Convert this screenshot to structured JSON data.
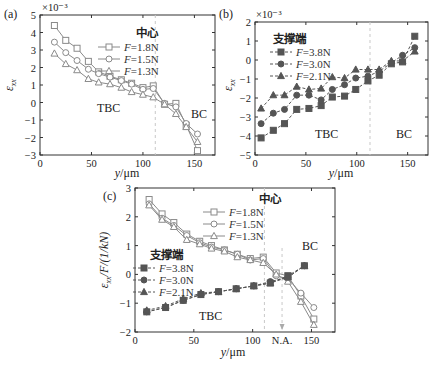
{
  "chart_data": [
    {
      "id": "a",
      "type": "line",
      "panel_label": "(a)",
      "title": "",
      "xlabel": "y/μm",
      "ylabel": "ε_xx",
      "y_multiplier": "×10⁻³",
      "xlim": [
        0,
        170
      ],
      "ylim": [
        -3,
        5
      ],
      "xticks": [
        0,
        50,
        100,
        150
      ],
      "yticks": [
        -3,
        -2,
        -1,
        0,
        1,
        2,
        3,
        4,
        5
      ],
      "grid": false,
      "legend_title": "中心",
      "legend_position": "upper right",
      "regions": [
        "TBC",
        "BC"
      ],
      "interface_x": 112,
      "series": [
        {
          "name": "F=1.8N",
          "marker": "square",
          "x": [
            14,
            25,
            36,
            47,
            57,
            68,
            79,
            89,
            100,
            110,
            121,
            132,
            142,
            153
          ],
          "y": [
            4.4,
            3.55,
            3.1,
            2.35,
            1.75,
            1.5,
            1.3,
            1.1,
            0.85,
            0.95,
            -0.1,
            -0.05,
            -1.3,
            -2.75
          ]
        },
        {
          "name": "F=1.5N",
          "marker": "circle",
          "x": [
            14,
            25,
            36,
            47,
            57,
            68,
            79,
            89,
            100,
            110,
            121,
            132,
            142,
            153
          ],
          "y": [
            3.45,
            2.85,
            2.4,
            1.9,
            1.65,
            1.45,
            1.25,
            1.05,
            0.75,
            0.8,
            -0.05,
            -0.25,
            -1.2,
            -1.8
          ]
        },
        {
          "name": "F=1.3N",
          "marker": "triangle",
          "x": [
            14,
            25,
            36,
            47,
            57,
            68,
            79,
            89,
            100,
            110,
            121,
            132,
            142,
            153
          ],
          "y": [
            2.8,
            2.2,
            1.85,
            1.35,
            1.15,
            1.05,
            0.85,
            0.6,
            0.45,
            0.3,
            -0.1,
            -0.65,
            -1.4,
            -2.25
          ]
        }
      ]
    },
    {
      "id": "b",
      "type": "line",
      "panel_label": "(b)",
      "title": "",
      "xlabel": "y/μm",
      "ylabel": "ε_xx",
      "y_multiplier": "×10⁻³",
      "xlim": [
        0,
        170
      ],
      "ylim": [
        -5,
        2
      ],
      "xticks": [
        0,
        50,
        100,
        150
      ],
      "yticks": [
        -5,
        -4,
        -3,
        -2,
        -1,
        0,
        1,
        2
      ],
      "grid": false,
      "legend_title": "支撑端",
      "legend_position": "upper left",
      "regions": [
        "TBC",
        "BC"
      ],
      "interface_x": 113,
      "series": [
        {
          "name": "F=3.8N",
          "marker": "square-filled",
          "x": [
            6,
            18,
            29,
            41,
            53,
            65,
            76,
            88,
            99,
            111,
            122,
            134,
            145,
            157
          ],
          "y": [
            -4.1,
            -3.7,
            -3.35,
            -2.6,
            -2.55,
            -2.4,
            -1.95,
            -1.9,
            -1.55,
            -1.1,
            -0.8,
            -0.2,
            -0.1,
            1.25
          ]
        },
        {
          "name": "F=3.0N",
          "marker": "circle-filled",
          "x": [
            6,
            18,
            29,
            41,
            53,
            65,
            76,
            88,
            99,
            111,
            122,
            134,
            145,
            157
          ],
          "y": [
            -3.35,
            -2.8,
            -2.6,
            -1.85,
            -1.85,
            -2.1,
            -1.55,
            -1.3,
            -0.95,
            -0.85,
            -0.6,
            -0.15,
            0.25,
            0.65
          ]
        },
        {
          "name": "F=2.1N",
          "marker": "triangle-filled",
          "x": [
            6,
            18,
            29,
            41,
            53,
            65,
            76,
            88,
            99,
            111,
            122,
            134,
            145,
            157
          ],
          "y": [
            -2.55,
            -1.85,
            -1.85,
            -1.4,
            -1.55,
            -1.5,
            -0.9,
            -0.95,
            -0.5,
            -0.5,
            -0.5,
            -0.05,
            -0.05,
            0.45
          ]
        }
      ]
    },
    {
      "id": "c",
      "type": "line",
      "panel_label": "(c)",
      "title": "",
      "xlabel": "y/μm",
      "ylabel": "ε_xx/F/(1/kN)",
      "xlim": [
        0,
        170
      ],
      "ylim": [
        -2,
        3
      ],
      "xticks": [
        0,
        50,
        100,
        150
      ],
      "xtick_extra": "N.A.",
      "yticks": [
        -2,
        -1,
        0,
        1,
        2,
        3
      ],
      "grid": false,
      "legend_groups": [
        {
          "title": "中心",
          "entries": [
            "F=1.8N",
            "F=1.5N",
            "F=1.3N"
          ],
          "position": "upper right"
        },
        {
          "title": "支撑端",
          "entries": [
            "F=3.8N",
            "F=3.0N",
            "F=2.1N"
          ],
          "position": "middle left"
        }
      ],
      "regions": [
        "TBC",
        "BC"
      ],
      "interface_x": 110,
      "neutral_axis_x": 125,
      "series": [
        {
          "name": "F=1.8N (中心)",
          "marker": "square",
          "x": [
            12,
            23,
            33,
            44,
            55,
            65,
            76,
            87,
            98,
            109,
            120,
            130,
            141,
            152
          ],
          "y": [
            2.6,
            2.1,
            1.8,
            1.4,
            1.15,
            1.0,
            0.85,
            0.7,
            0.55,
            0.6,
            0.05,
            -0.05,
            -0.75,
            -1.55
          ]
        },
        {
          "name": "F=1.5N (中心)",
          "marker": "circle",
          "x": [
            12,
            23,
            33,
            44,
            55,
            65,
            76,
            87,
            98,
            109,
            120,
            130,
            141,
            152
          ],
          "y": [
            2.45,
            1.95,
            1.7,
            1.35,
            1.1,
            0.95,
            0.85,
            0.7,
            0.5,
            0.55,
            -0.05,
            -0.15,
            -0.65,
            -1.15
          ]
        },
        {
          "name": "F=1.3N (中心)",
          "marker": "triangle",
          "x": [
            12,
            23,
            33,
            44,
            55,
            65,
            76,
            87,
            98,
            109,
            120,
            130,
            141,
            152
          ],
          "y": [
            2.4,
            1.9,
            1.65,
            1.2,
            1.05,
            0.9,
            0.8,
            0.6,
            0.5,
            0.4,
            0.0,
            -0.25,
            -0.95,
            -1.75
          ]
        },
        {
          "name": "F=3.8N (支撑端)",
          "marker": "square-filled",
          "x": [
            10,
            26,
            41,
            56,
            71,
            86,
            101,
            115,
            130,
            144
          ],
          "y": [
            -1.3,
            -1.15,
            -0.9,
            -0.7,
            -0.6,
            -0.5,
            -0.4,
            -0.3,
            -0.05,
            0.3
          ]
        },
        {
          "name": "F=3.0N (支撑端)",
          "marker": "circle-filled",
          "x": [
            10,
            26,
            41,
            56,
            71,
            86,
            101,
            115,
            130,
            144
          ],
          "y": [
            -1.3,
            -1.15,
            -0.9,
            -0.7,
            -0.6,
            -0.5,
            -0.4,
            -0.25,
            -0.1,
            0.3
          ]
        },
        {
          "name": "F=2.1N (支撑端)",
          "marker": "triangle-filled",
          "x": [
            10,
            26,
            41,
            56,
            71,
            86,
            101,
            115,
            130,
            144
          ],
          "y": [
            -1.25,
            -1.1,
            -0.85,
            -0.65,
            -0.6,
            -0.5,
            -0.4,
            -0.3,
            -0.1,
            0.3
          ]
        }
      ]
    }
  ],
  "colors": {
    "axis": "#333333",
    "open_series": "#8a8a8a",
    "filled_series": "#555555",
    "interface_dash": "#c8c8c8"
  }
}
